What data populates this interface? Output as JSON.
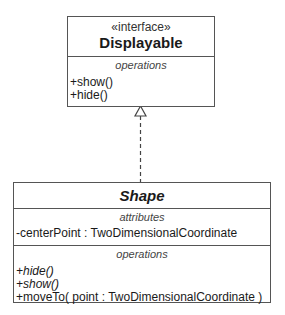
{
  "interface_class": {
    "stereotype": "«interface»",
    "name": "Displayable",
    "operations_label": "operations",
    "operations": [
      "+show()",
      "+hide()"
    ]
  },
  "shape_class": {
    "name": "Shape",
    "attributes_label": "attributes",
    "attributes": [
      "-centerPoint : TwoDimensionalCoordinate"
    ],
    "operations_label": "operations",
    "operations": [
      {
        "text": "+hide()",
        "abstract": true
      },
      {
        "text": "+show()",
        "abstract": true
      },
      {
        "text": "+moveTo( point : TwoDimensionalCoordinate )",
        "abstract": false
      }
    ]
  },
  "relationship": {
    "type": "realization",
    "from": "Shape",
    "to": "Displayable"
  }
}
